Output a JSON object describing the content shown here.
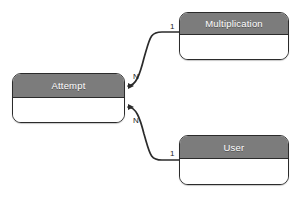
{
  "diagram": {
    "type": "entity-relationship-diagram",
    "background_color": "#ffffff",
    "header_color": "#7c7c7c",
    "header_text_color": "#ffffff",
    "body_color": "#ffffff",
    "border_color": "#2b2b2b",
    "entities": [
      {
        "id": "attempt",
        "name": "Attempt",
        "x": 12,
        "y": 73,
        "width": 113,
        "height": 50,
        "header_height": 24
      },
      {
        "id": "multiplication",
        "name": "Multiplication",
        "x": 179,
        "y": 12,
        "width": 110,
        "height": 48,
        "header_height": 22
      },
      {
        "id": "user",
        "name": "User",
        "x": 179,
        "y": 135,
        "width": 110,
        "height": 50,
        "header_height": 23
      }
    ],
    "relationships": [
      {
        "id": "attempt-multiplication",
        "from": "multiplication",
        "to": "attempt",
        "from_cardinality": "1",
        "to_cardinality": "N",
        "arrowhead_at": "attempt"
      },
      {
        "id": "attempt-user",
        "from": "user",
        "to": "attempt",
        "from_cardinality": "1",
        "to_cardinality": "N",
        "arrowhead_at": "attempt"
      }
    ],
    "cardinality_labels": [
      {
        "id": "n-upper",
        "text": "N",
        "x": 133,
        "y": 73
      },
      {
        "id": "one-multiplication",
        "text": "1",
        "x": 170,
        "y": 23
      },
      {
        "id": "n-lower",
        "text": "N",
        "x": 133,
        "y": 117
      },
      {
        "id": "one-user",
        "text": "1",
        "x": 170,
        "y": 150
      }
    ]
  }
}
